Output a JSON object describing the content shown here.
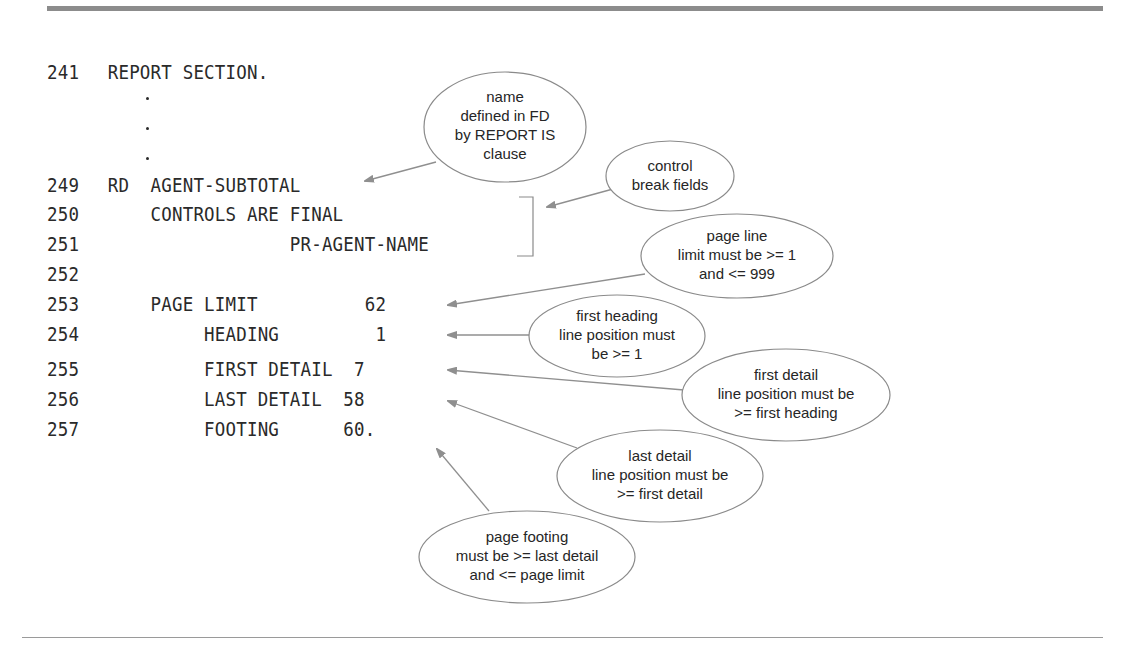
{
  "code": {
    "lines": [
      {
        "num": "241",
        "text": "REPORT SECTION."
      },
      {
        "num": "249",
        "text": "RD  AGENT-SUBTOTAL"
      },
      {
        "num": "250",
        "text": "    CONTROLS ARE FINAL"
      },
      {
        "num": "251",
        "text": "                 PR-AGENT-NAME"
      },
      {
        "num": "252",
        "text": ""
      },
      {
        "num": "253",
        "text": "    PAGE LIMIT          62"
      },
      {
        "num": "254",
        "text": "         HEADING         1"
      },
      {
        "num": "255",
        "text": "         FIRST DETAIL  7"
      },
      {
        "num": "256",
        "text": "         LAST DETAIL  58"
      },
      {
        "num": "257",
        "text": "         FOOTING      60."
      }
    ],
    "ellipsis": ".",
    "text_color": "#2a2a2a"
  },
  "callouts": [
    {
      "id": "report-name",
      "lines": [
        "name",
        "defined in FD",
        "by REPORT IS",
        "clause"
      ],
      "target": "AGENT-SUBTOTAL"
    },
    {
      "id": "control-break",
      "lines": [
        "control",
        "break fields"
      ],
      "target": "CONTROLS ARE FINAL / PR-AGENT-NAME"
    },
    {
      "id": "page-limit",
      "lines": [
        "page line",
        "limit must be >= 1",
        "and <= 999"
      ],
      "target": "62"
    },
    {
      "id": "first-heading",
      "lines": [
        "first heading",
        "line position must",
        "be >= 1"
      ],
      "target": "1"
    },
    {
      "id": "first-detail",
      "lines": [
        "first detail",
        "line position must be",
        ">= first heading"
      ],
      "target": "7"
    },
    {
      "id": "last-detail",
      "lines": [
        "last detail",
        "line position must be",
        ">= first detail"
      ],
      "target": "58"
    },
    {
      "id": "page-footing",
      "lines": [
        "page footing",
        "must be >= last detail",
        "and <= page limit"
      ],
      "target": "60."
    }
  ],
  "colors": {
    "rule": "#8c8c8c",
    "arrow": "#8f8f8f",
    "bubble_stroke": "#8a8a8a",
    "text": "#262626"
  }
}
